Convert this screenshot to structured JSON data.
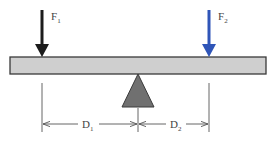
{
  "diagram": {
    "forces": [
      {
        "id": "F1",
        "label": "F",
        "subscript": "1",
        "color": "#1c1c1c"
      },
      {
        "id": "F2",
        "label": "F",
        "subscript": "2",
        "color": "#2f55b8"
      }
    ],
    "distances": [
      {
        "id": "D1",
        "label": "D",
        "subscript": "1"
      },
      {
        "id": "D2",
        "label": "D",
        "subscript": "2"
      }
    ],
    "colors": {
      "beam_fill": "#cfcfcf",
      "beam_stroke": "#3a3a3a",
      "fulcrum_fill": "#707070",
      "dimension_line": "#555555"
    }
  }
}
